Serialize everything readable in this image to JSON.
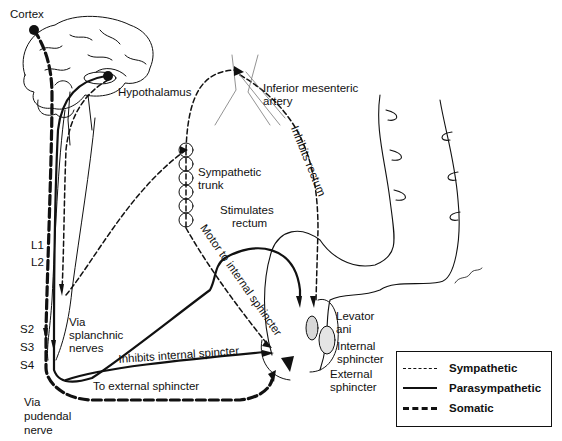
{
  "diagram": {
    "labels": {
      "cortex": "Cortex",
      "hypothalamus": "Hypothalamus",
      "inferior_mesenteric_1": "Inferior mesenteric",
      "inferior_mesenteric_2": "artery",
      "inhibits_rectum": "Inhibits rectum",
      "sympathetic_trunk_1": "Sympathetic",
      "sympathetic_trunk_2": "trunk",
      "stimulates_rectum_1": "Stimulates",
      "stimulates_rectum_2": "rectum",
      "motor_internal": "Motor to internal sphincter",
      "l1": "L1",
      "l2": "L2",
      "s2": "S2",
      "s3": "S3",
      "s4": "S4",
      "via_splanchnic_1": "Via",
      "via_splanchnic_2": "splanchnic",
      "via_splanchnic_3": "nerves",
      "inhibits_internal": "Inhibits internal spincter",
      "to_external": "To external sphincter",
      "via_pudendal_1": "Via",
      "via_pudendal_2": "pudendal",
      "via_pudendal_3": "nerve",
      "levator_1": "Levator",
      "levator_2": "ani",
      "internal_sph_1": "Internal",
      "internal_sph_2": "sphincter",
      "external_sph_1": "External",
      "external_sph_2": "sphincter"
    },
    "legend": {
      "items": [
        {
          "label": "Sympathetic",
          "style": "dashed-thin"
        },
        {
          "label": "Parasympathetic",
          "style": "solid"
        },
        {
          "label": "Somatic",
          "style": "dashed-thick"
        }
      ]
    },
    "colors": {
      "ink": "#111111",
      "background": "#ffffff",
      "shade": "#d8d8d8"
    }
  }
}
